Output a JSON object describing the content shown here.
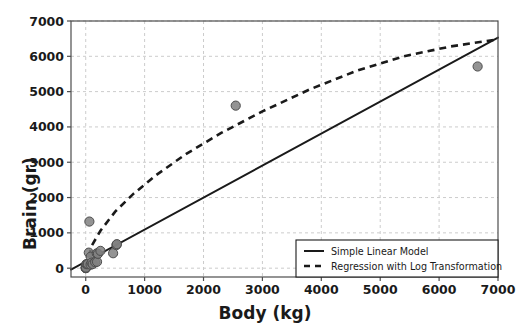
{
  "chart_data": {
    "type": "scatter",
    "title": "",
    "xlabel": "Body (kg)",
    "ylabel": "Brain (gr)",
    "xlim": [
      -250,
      7000
    ],
    "ylim": [
      -250,
      7000
    ],
    "xticks": [
      0,
      1000,
      2000,
      3000,
      4000,
      5000,
      6000,
      7000
    ],
    "yticks": [
      0,
      1000,
      2000,
      3000,
      4000,
      5000,
      6000,
      7000
    ],
    "xticklabels": [
      "0",
      "1000",
      "2000",
      "3000",
      "4000",
      "5000",
      "6000",
      "7000"
    ],
    "yticklabels": [
      "0",
      "1000",
      "2000",
      "3000",
      "4000",
      "5000",
      "6000",
      "7000"
    ],
    "grid": true,
    "grid_style": "dashed",
    "grid_color": "#cccccc",
    "legend_position": "lower right",
    "marker_color": "#808080",
    "marker_edge_color": "#4d4d4d",
    "line_color": "#1a1a1a",
    "points": [
      {
        "x": 0.023,
        "y": 0.4
      },
      {
        "x": 0.785,
        "y": 3.5
      },
      {
        "x": 1.41,
        "y": 17.5
      },
      {
        "x": 3.3,
        "y": 25.6
      },
      {
        "x": 3.5,
        "y": 3.9
      },
      {
        "x": 4.05,
        "y": 17.0
      },
      {
        "x": 10.0,
        "y": 115.0
      },
      {
        "x": 27.66,
        "y": 115.0
      },
      {
        "x": 36.33,
        "y": 119.5
      },
      {
        "x": 52.16,
        "y": 440.0
      },
      {
        "x": 62.0,
        "y": 1320.0
      },
      {
        "x": 83.0,
        "y": 98.2
      },
      {
        "x": 85.0,
        "y": 325.0
      },
      {
        "x": 100.0,
        "y": 157.0
      },
      {
        "x": 119.5,
        "y": 115.0
      },
      {
        "x": 160.0,
        "y": 169.0
      },
      {
        "x": 187.1,
        "y": 419.0
      },
      {
        "x": 192.0,
        "y": 180.0
      },
      {
        "x": 207.0,
        "y": 406.0
      },
      {
        "x": 250.0,
        "y": 490.0
      },
      {
        "x": 465.0,
        "y": 423.0
      },
      {
        "x": 521.0,
        "y": 655.0
      },
      {
        "x": 529.0,
        "y": 680.0
      },
      {
        "x": 2547.0,
        "y": 4603.0
      },
      {
        "x": 6654.0,
        "y": 5712.0
      }
    ],
    "series": [
      {
        "name": "Simple Linear Model",
        "style": "solid",
        "type": "line",
        "x": [
          -250,
          7000
        ],
        "y": [
          -40,
          6530
        ]
      },
      {
        "name": "Regression with Log Transformation",
        "style": "dashed",
        "type": "curve",
        "x": [
          0,
          100,
          250,
          500,
          800,
          1200,
          1700,
          2300,
          3000,
          3800,
          4600,
          5400,
          6200,
          7000
        ],
        "y": [
          0,
          630,
          1060,
          1600,
          2090,
          2640,
          3230,
          3830,
          4440,
          5060,
          5590,
          6000,
          6280,
          6480
        ]
      }
    ]
  },
  "legend": {
    "items": [
      {
        "label": "Simple Linear Model",
        "style": "solid"
      },
      {
        "label": "Regression with Log Transformation",
        "style": "dashed"
      }
    ]
  }
}
